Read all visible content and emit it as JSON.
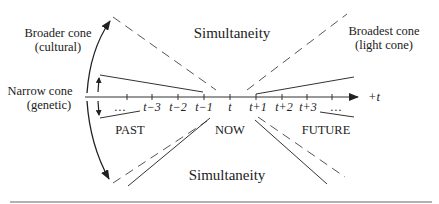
{
  "labels": {
    "broader_cone_line1": "Broader cone",
    "broader_cone_line2": "(cultural)",
    "narrow_cone_line1": "Narrow cone",
    "narrow_cone_line2": "(genetic)",
    "broadest_cone_line1": "Broadest cone",
    "broadest_cone_line2": "(light cone)",
    "simultaneity_top": "Simultaneity",
    "simultaneity_bottom": "Simultaneity",
    "past": "PAST",
    "now": "NOW",
    "future": "FUTURE",
    "axis_label": "+t"
  },
  "axis": {
    "ticks": [
      {
        "label": "…"
      },
      {
        "label": "t−3"
      },
      {
        "label": "t−2"
      },
      {
        "label": "t−1"
      },
      {
        "label": "t"
      },
      {
        "label": "t+1"
      },
      {
        "label": "t+2"
      },
      {
        "label": "t+3"
      },
      {
        "label": "…"
      }
    ]
  },
  "colors": {
    "line": "#333333",
    "dashed": "#555555",
    "text": "#222222",
    "separator": "#999999"
  }
}
